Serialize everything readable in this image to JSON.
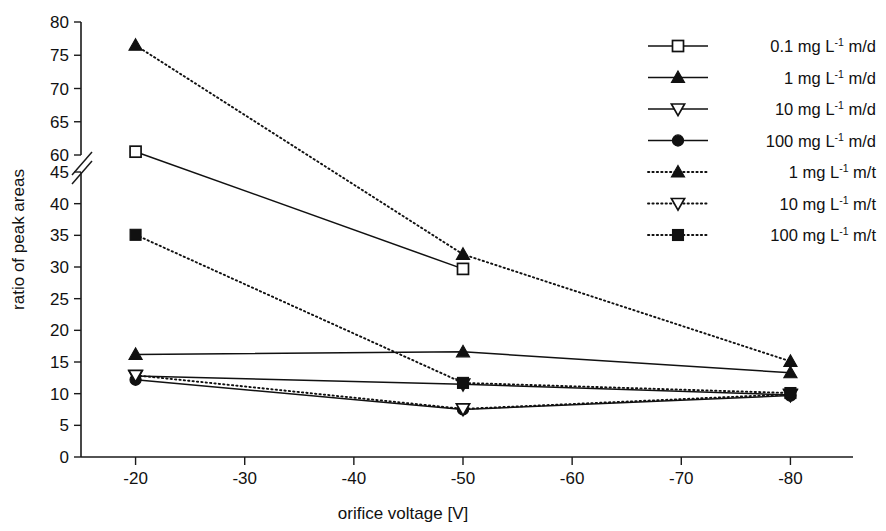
{
  "chart_data": {
    "type": "line",
    "title": "",
    "xlabel": "orifice voltage [V]",
    "ylabel": "ratio of peak areas",
    "grid": false,
    "legend_position": "top-right",
    "x": [
      -20,
      -50,
      -80
    ],
    "xlim": [
      -15,
      -85
    ],
    "xticks": [
      -20,
      -30,
      -40,
      -50,
      -60,
      -70,
      -80
    ],
    "xticklabels": [
      "-20",
      "-30",
      "-40",
      "-50",
      "-60",
      "-70",
      "-80"
    ],
    "y_axis_broken": true,
    "y_segment_lower": [
      0,
      45
    ],
    "y_segment_upper": [
      60,
      80
    ],
    "yticks_lower": [
      0,
      5,
      10,
      15,
      20,
      25,
      30,
      35,
      40,
      45
    ],
    "yticks_upper": [
      60,
      65,
      70,
      75,
      80
    ],
    "yticklabels_lower": [
      "0",
      "5",
      "10",
      "15",
      "20",
      "25",
      "30",
      "35",
      "40",
      "45"
    ],
    "yticklabels_upper": [
      "60",
      "65",
      "70",
      "75",
      "80"
    ],
    "series": [
      {
        "name": "0.1 mg L-1 m/d",
        "label_value": "0.1",
        "label_unit": "mg L",
        "label_sup": "-1",
        "label_suffix": "m/d",
        "marker": "square-open",
        "line": "solid",
        "values": [
          60.5,
          29.7,
          null
        ]
      },
      {
        "name": "1 mg L-1 m/d",
        "label_value": "1",
        "label_unit": "mg L",
        "label_sup": "-1",
        "label_suffix": "m/d",
        "marker": "triangle-up-filled",
        "line": "solid",
        "values": [
          16.2,
          16.6,
          13.3
        ]
      },
      {
        "name": "10 mg L-1 m/d",
        "label_value": "10",
        "label_unit": "mg L",
        "label_sup": "-1",
        "label_suffix": "m/d",
        "marker": "triangle-down-open",
        "line": "solid",
        "values": [
          12.8,
          11.5,
          9.8
        ]
      },
      {
        "name": "100 mg L-1 m/d",
        "label_value": "100",
        "label_unit": "mg L",
        "label_sup": "-1",
        "label_suffix": "m/d",
        "marker": "circle-filled",
        "line": "solid",
        "values": [
          12.2,
          7.5,
          9.7
        ]
      },
      {
        "name": "1 mg L-1 m/t",
        "label_value": "1",
        "label_unit": "mg L",
        "label_sup": "-1",
        "label_suffix": "m/t",
        "marker": "triangle-up-filled",
        "line": "dotted",
        "values": [
          76.5,
          32.0,
          15.1
        ]
      },
      {
        "name": "10 mg L-1 m/t",
        "label_value": "10",
        "label_unit": "mg L",
        "label_sup": "-1",
        "label_suffix": "m/t",
        "marker": "triangle-down-open",
        "line": "dotted",
        "values": [
          12.9,
          7.6,
          9.9
        ]
      },
      {
        "name": "100 mg L-1 m/t",
        "label_value": "100",
        "label_unit": "mg L",
        "label_sup": "-1",
        "label_suffix": "m/t",
        "marker": "square-filled",
        "line": "dotted",
        "values": [
          48.0,
          11.7,
          10.1
        ]
      }
    ],
    "colors": {
      "ink": "#111111",
      "background": "#ffffff"
    }
  }
}
